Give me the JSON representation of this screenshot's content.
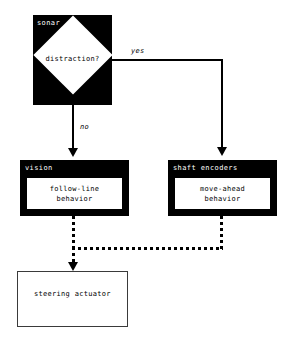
{
  "diagram": {
    "colors": {
      "module_fill": "#000000",
      "module_label": "#ffffff",
      "canvas": "#ffffff",
      "line": "#000000",
      "plain_border": "#3a3a3a"
    },
    "nodes": {
      "sonar": {
        "label": "sonar",
        "decision": "distraction?"
      },
      "vision": {
        "label": "vision",
        "behavior": "follow-line\nbehavior"
      },
      "shaft_encoders": {
        "label": "shaft encoders",
        "behavior": "move-ahead\nbehavior"
      },
      "steering_actuator": {
        "label": "steering actuator"
      }
    },
    "edges": {
      "yes": "yes",
      "no": "no"
    }
  }
}
